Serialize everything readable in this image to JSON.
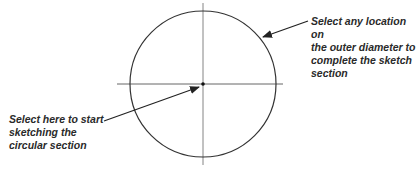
{
  "diagram": {
    "type": "sketch-instruction",
    "shape": "circle",
    "colors": {
      "stroke": "#333333",
      "centerline": "#555555",
      "text": "#2a2a2a",
      "background": "#ffffff"
    },
    "circle": {
      "cx": 203,
      "cy": 84,
      "r": 73
    },
    "center_point": {
      "cx": 203,
      "cy": 84
    },
    "callouts": {
      "right": {
        "text": "Select any location on\nthe outer diameter to\ncomplete the sketch\nsection",
        "target": "outer-diameter"
      },
      "left": {
        "text": "Select here to start\nsketching the\ncircular section",
        "target": "center-point"
      }
    }
  }
}
